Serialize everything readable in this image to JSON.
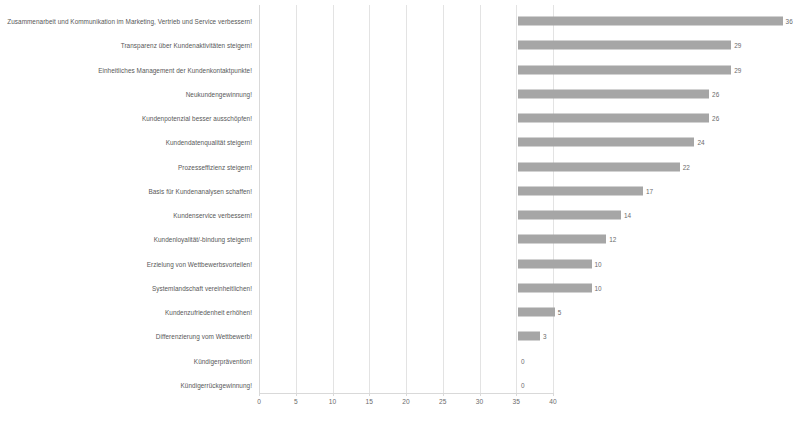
{
  "chart_data": {
    "type": "bar",
    "orientation": "horizontal",
    "title": "",
    "xlabel": "",
    "ylabel": "",
    "xlim": [
      0,
      40
    ],
    "xticks": [
      0,
      5,
      10,
      15,
      20,
      25,
      30,
      35,
      40
    ],
    "grid": true,
    "legend": false,
    "bar_color": "#a6a6a6",
    "gridline_color": "#e3e3e3",
    "value_labels": true,
    "categories": [
      "Zusammenarbeit und Kommunikation im Marketing, Vertrieb und Service verbessern!",
      "Transparenz über Kundenaktivitäten steigern!",
      "Einheitliches Management der Kundenkontaktpunkte!",
      "Neukundengewinnung!",
      "Kundenpotenzial besser ausschöpfen!",
      "Kundendatenqualität steigern!",
      "Prozesseffizienz steigern!",
      "Basis für Kundenanalysen schaffen!",
      "Kundenservice verbessern!",
      "Kundenloyalität/-bindung steigern!",
      "Erzielung von Wettbewerbsvorteilen!",
      "Systemlandschaft vereinheitlichen!",
      "Kundenzufriedenheit erhöhen!",
      "Differenzierung vom Wettbewerb!",
      "Kündigerprävention!",
      "Kündigerrückgewinnung!"
    ],
    "values": [
      36,
      29,
      29,
      26,
      26,
      24,
      22,
      17,
      14,
      12,
      10,
      10,
      5,
      3,
      0,
      0
    ],
    "value_label_texts": [
      "36",
      "29",
      "29",
      "26",
      "26",
      "24",
      "22",
      "17",
      "14",
      "12",
      "10",
      "10",
      "5",
      "3",
      "0",
      "0"
    ],
    "xtick_labels": [
      "0",
      "5",
      "10",
      "15",
      "20",
      "25",
      "30",
      "35",
      "40"
    ]
  }
}
